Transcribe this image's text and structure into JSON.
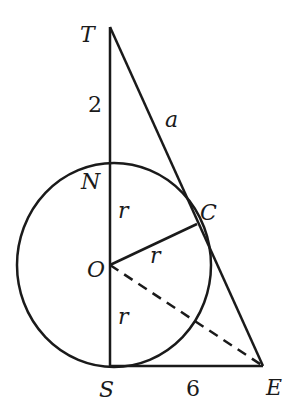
{
  "diagram": {
    "points": {
      "T": {
        "label": "T",
        "x": 110,
        "y": 27
      },
      "N": {
        "label": "N",
        "x": 110,
        "y": 163
      },
      "O": {
        "label": "O",
        "x": 110,
        "y": 265
      },
      "S": {
        "label": "S",
        "x": 110,
        "y": 366
      },
      "C": {
        "label": "C",
        "x": 197,
        "y": 224
      },
      "E": {
        "label": "E",
        "x": 263,
        "y": 366
      }
    },
    "circle": {
      "cx": 114,
      "cy": 265,
      "rx": 97,
      "ry": 102
    },
    "segment_labels": {
      "TN": "2",
      "TE": "a",
      "NO": "r",
      "OC": "r",
      "OS": "r",
      "SE": "6"
    },
    "colors": {
      "stroke": "#1a1a1a",
      "background": "#ffffff"
    }
  }
}
